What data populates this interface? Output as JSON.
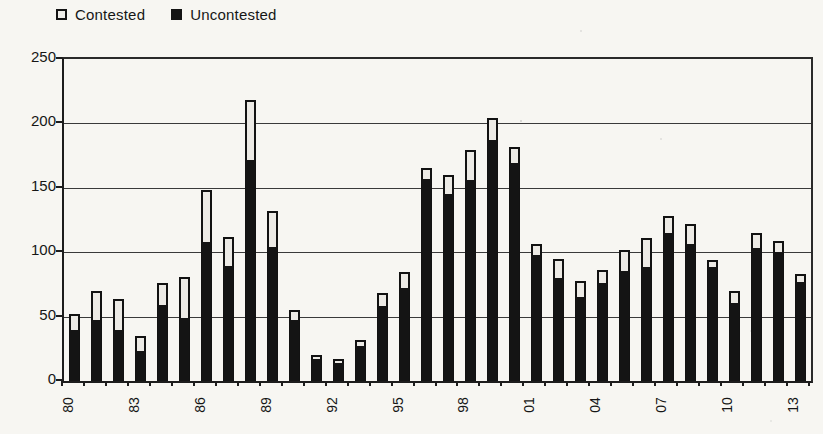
{
  "page": {
    "background": "#f7f6f2"
  },
  "legend": {
    "items": [
      {
        "label": "Contested",
        "swatch": "outlined"
      },
      {
        "label": "Uncontested",
        "swatch": "filled"
      }
    ]
  },
  "chart_data": {
    "type": "bar",
    "stacked": true,
    "title": "",
    "xlabel": "",
    "ylabel": "",
    "categories": [
      1980,
      1981,
      1982,
      1983,
      1984,
      1985,
      1986,
      1987,
      1988,
      1989,
      1990,
      1991,
      1992,
      1993,
      1994,
      1995,
      1996,
      1997,
      1998,
      1999,
      2000,
      2001,
      2002,
      2003,
      2004,
      2005,
      2006,
      2007,
      2008,
      2009,
      2010,
      2011,
      2012,
      2013
    ],
    "xtick_labels_shown": [
      "80",
      "83",
      "86",
      "89",
      "92",
      "95",
      "98",
      "01",
      "04",
      "07",
      "10",
      "13"
    ],
    "xtick_every": 3,
    "series": [
      {
        "name": "Uncontested",
        "color": "#141414",
        "values": [
          40,
          48,
          40,
          24,
          60,
          50,
          109,
          90,
          172,
          105,
          48,
          18,
          15,
          28,
          59,
          73,
          158,
          146,
          157,
          188,
          170,
          99,
          81,
          66,
          77,
          86,
          89,
          116,
          107,
          89,
          61,
          104,
          101,
          78
        ]
      },
      {
        "name": "Contested",
        "color": "#eceae5",
        "values": [
          12,
          22,
          24,
          11,
          16,
          31,
          39,
          22,
          46,
          27,
          7,
          2,
          2,
          4,
          9,
          12,
          7,
          14,
          22,
          16,
          12,
          7,
          14,
          12,
          9,
          16,
          22,
          12,
          15,
          5,
          9,
          11,
          8,
          5
        ]
      }
    ],
    "ylim": [
      0,
      250
    ],
    "yticks": [
      0,
      50,
      100,
      150,
      200,
      250
    ],
    "grid": true,
    "legend_position": "top-left"
  }
}
